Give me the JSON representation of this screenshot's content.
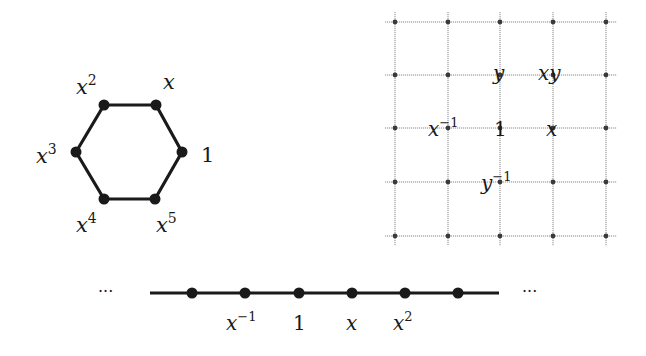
{
  "diagrams": {
    "cyclic_group": {
      "title": "Cayley graph of cyclic group of order 6 (hexagon)",
      "vertices": [
        {
          "base": "1",
          "exp": "",
          "x": 182,
          "y": 152
        },
        {
          "base": "x",
          "exp": "",
          "x": 156,
          "y": 105
        },
        {
          "base": "x",
          "exp": "2",
          "x": 104,
          "y": 105
        },
        {
          "base": "x",
          "exp": "3",
          "x": 76,
          "y": 152
        },
        {
          "base": "x",
          "exp": "4",
          "x": 104,
          "y": 199
        },
        {
          "base": "x",
          "exp": "5",
          "x": 155,
          "y": 199
        }
      ],
      "labels": {
        "v0": "1",
        "v1": "x",
        "v2_base": "x",
        "v2_exp": "2",
        "v3_base": "x",
        "v3_exp": "3",
        "v4_base": "x",
        "v4_exp": "4",
        "v5_base": "x",
        "v5_exp": "5"
      }
    },
    "free_abelian_grid": {
      "title": "Cayley graph of Z×Z (square grid)",
      "columns_x": [
        395,
        448,
        500,
        553,
        606
      ],
      "rows_y": [
        22,
        75,
        128,
        182,
        236
      ],
      "labels": {
        "y": "y",
        "xy": "xy",
        "x_inv_base": "x",
        "x_inv_exp": "−1",
        "one": "1",
        "x": "x",
        "y_inv_base": "y",
        "y_inv_exp": "−1"
      }
    },
    "infinite_cyclic": {
      "title": "Cayley graph of Z (line)",
      "dots_x": [
        192,
        245,
        299,
        352,
        405,
        458
      ],
      "line_y": 293,
      "ellipsis_left": "···",
      "ellipsis_right": "···",
      "labels": {
        "x_inv_base": "x",
        "x_inv_exp": "−1",
        "one": "1",
        "x": "x",
        "x2_base": "x",
        "x2_exp": "2"
      }
    }
  }
}
